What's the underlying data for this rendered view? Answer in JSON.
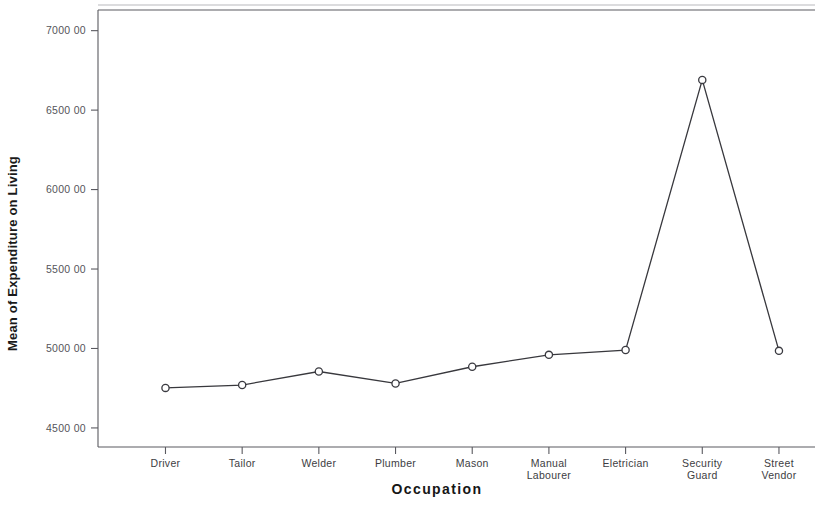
{
  "chart_data": {
    "type": "line",
    "title": "",
    "xlabel": "Occupation",
    "ylabel": "Mean of Expenditure on Living",
    "categories": [
      "Driver",
      "Tailor",
      "Welder",
      "Plumber",
      "Mason",
      "Manual\nLabourer",
      "Eletrician",
      "Security\nGuard",
      "Street\nVendor"
    ],
    "category_labels": [
      [
        "Driver"
      ],
      [
        "Tailor"
      ],
      [
        "Welder"
      ],
      [
        "Plumber"
      ],
      [
        "Mason"
      ],
      [
        "Manual",
        "Labourer"
      ],
      [
        "Eletrician"
      ],
      [
        "Security",
        "Guard"
      ],
      [
        "Street",
        "Vendor"
      ]
    ],
    "values": [
      4752,
      4770,
      4855,
      4780,
      4885,
      4960,
      4990,
      6690,
      4985
    ],
    "ylim": [
      4380,
      7130
    ],
    "ytick_values": [
      4500,
      5000,
      5500,
      6000,
      6500,
      7000
    ],
    "ytick_labels": [
      "4500 00",
      "5000 00",
      "5500 00",
      "6000 00",
      "6500 00",
      "7000 00"
    ],
    "grid": false,
    "legend": null,
    "marker": "open-circle",
    "line_color": "#38383d",
    "marker_fill": "#ffffff",
    "background_color": "#ffffff"
  }
}
